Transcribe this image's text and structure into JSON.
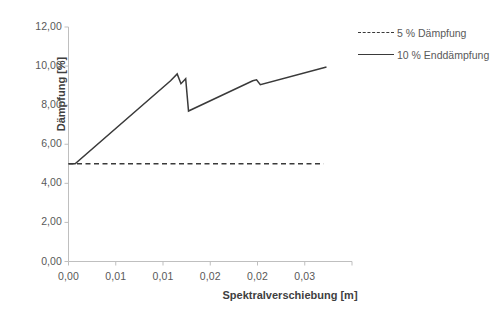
{
  "chart_data": {
    "type": "line",
    "title": "",
    "xlabel": "Spektralverschiebung [m]",
    "ylabel": "Dämpfung [%]",
    "xlim": [
      0,
      0.03
    ],
    "ylim": [
      0,
      12
    ],
    "grid": false,
    "legend_position": "top-right",
    "x_tick_values": [
      0,
      0.005,
      0.01,
      0.015,
      0.02,
      0.025,
      0.03
    ],
    "x_tick_labels": [
      "0,00",
      "0,01",
      "0,01",
      "0,02",
      "0,02",
      "0,03"
    ],
    "y_tick_values": [
      0,
      2,
      4,
      6,
      8,
      10,
      12
    ],
    "y_tick_labels": [
      "0,00",
      "2,00",
      "4,00",
      "6,00",
      "8,00",
      "10,00",
      "12,00"
    ],
    "series": [
      {
        "name": "5 % Dämpfung",
        "style": "dashed",
        "color": "#3a3a3a",
        "x": [
          0.0,
          0.027
        ],
        "values": [
          5.0,
          5.0
        ]
      },
      {
        "name": "10 % Enddämpfung",
        "style": "solid",
        "color": "#3a3a3a",
        "x": [
          0.0,
          0.0007,
          0.0108,
          0.0115,
          0.0119,
          0.0124,
          0.0127,
          0.0195,
          0.0199,
          0.0203,
          0.0273
        ],
        "values": [
          5.0,
          5.0,
          9.25,
          9.6,
          9.1,
          9.35,
          7.7,
          9.25,
          9.3,
          9.05,
          9.95
        ]
      }
    ]
  },
  "legend": {
    "items": [
      {
        "label": "5 % Dämpfung"
      },
      {
        "label": "10 % Enddämpfung"
      }
    ]
  }
}
